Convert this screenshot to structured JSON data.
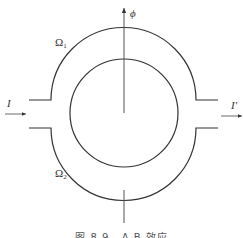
{
  "figure": {
    "caption": "图 8.9   A-B 效应",
    "labels": {
      "phi": "ϕ",
      "omega1_main": "Ω",
      "omega1_sub": "1",
      "omega2_main": "Ω",
      "omega2_sub": "2",
      "input_current": "I",
      "output_current": "I′"
    },
    "colors": {
      "stroke": "#333333",
      "background": "#ffffff"
    }
  }
}
